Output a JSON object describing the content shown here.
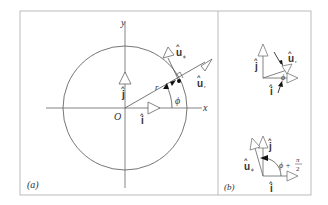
{
  "panel_a": {
    "label": "(a)",
    "axis_x": "x",
    "axis_y": "y",
    "origin": "O",
    "radius_label": "r",
    "angle_label": "ϕ",
    "unit_i": "i",
    "unit_j": "j",
    "unit_ur": "u",
    "unit_ur_sub": "r",
    "unit_uphi": "u",
    "unit_uphi_sub": "ϕ",
    "hat": "^"
  },
  "panel_b": {
    "label": "(b)",
    "top": {
      "unit_i": "i",
      "unit_j": "j",
      "unit_ur": "u",
      "unit_ur_sub": "r",
      "angle_label": "ϕ"
    },
    "bottom": {
      "unit_i": "i",
      "unit_j": "j",
      "unit_uphi": "u",
      "unit_uphi_sub": "ϕ",
      "angle_label": "ϕ +",
      "angle_num": "π",
      "angle_den": "2"
    }
  },
  "colors": {
    "line": "#555555",
    "frame": "#bbbbbb",
    "arrowhead_fill": "#ffffff",
    "dark": "#111111"
  }
}
